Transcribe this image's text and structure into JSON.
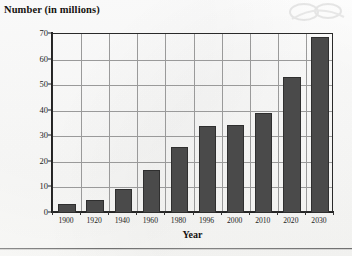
{
  "chart_data": {
    "type": "bar",
    "title": "Number (in millions)",
    "xlabel": "Year",
    "ylabel": "Number (in millions)",
    "categories": [
      "1900",
      "1920",
      "1940",
      "1960",
      "1980",
      "1996",
      "2000",
      "2010",
      "2020",
      "2030"
    ],
    "values": [
      3.5,
      5,
      9.5,
      17,
      26,
      34,
      34.5,
      39,
      53,
      69
    ],
    "ylim": [
      0,
      70
    ],
    "ytick_labels": [
      "0",
      "10",
      "20",
      "30",
      "40",
      "50",
      "60",
      "70"
    ],
    "ytick_values": [
      0,
      10,
      20,
      30,
      40,
      50,
      60,
      70
    ],
    "grid": "horizontal-and-vertical",
    "legend": "none",
    "bar_color": "#4a4a4a",
    "bar_edge_color": "#2f2f2f",
    "grid_color": "#9a9a9a",
    "axis_color": "#232323",
    "background_color": "#fdfdfc"
  },
  "figure": {
    "title_text": "Number (in millions)",
    "x_axis_title": "Year"
  },
  "icons": {
    "watermark": "watermark-smudge"
  }
}
